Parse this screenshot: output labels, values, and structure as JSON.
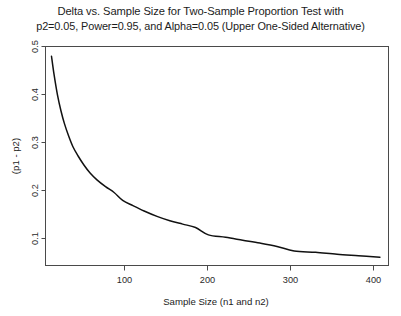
{
  "chart_data": {
    "type": "line",
    "title": "Delta vs. Sample Size for Two-Sample Proportion Test with",
    "subtitle": "p2=0.05, Power=0.95, and Alpha=0.05 (Upper One-Sided Alternative)",
    "xlabel": "Sample Size (n1 and n2)",
    "ylabel": "(p1 - p2)",
    "xlim": [
      10,
      410
    ],
    "ylim": [
      0.06,
      0.51
    ],
    "xticks": [
      100,
      200,
      300,
      400
    ],
    "xtick_labels": [
      "100",
      "200",
      "300",
      "400"
    ],
    "yticks": [
      0.1,
      0.2,
      0.3,
      0.4,
      0.5
    ],
    "ytick_labels": [
      "0.1",
      "0.2",
      "0.3",
      "0.4",
      "0.5"
    ],
    "grid": false,
    "legend": null,
    "series": [
      {
        "name": "delta",
        "color": "#111111",
        "x": [
          17,
          20,
          24,
          28,
          32,
          37,
          42,
          48,
          55,
          62,
          70,
          80,
          90,
          100,
          112,
          125,
          140,
          155,
          170,
          185,
          200,
          220,
          240,
          260,
          280,
          300,
          325,
          350,
          375,
          400
        ],
        "y": [
          0.49,
          0.452,
          0.41,
          0.378,
          0.352,
          0.326,
          0.304,
          0.285,
          0.266,
          0.25,
          0.236,
          0.222,
          0.21,
          0.194,
          0.183,
          0.172,
          0.161,
          0.152,
          0.145,
          0.138,
          0.123,
          0.118,
          0.112,
          0.106,
          0.099,
          0.09,
          0.087,
          0.083,
          0.08,
          0.077
        ]
      }
    ]
  },
  "figure": {
    "background_color": "#ffffff",
    "curve_color": "#111111",
    "axis_color": "#4a4a4a"
  }
}
